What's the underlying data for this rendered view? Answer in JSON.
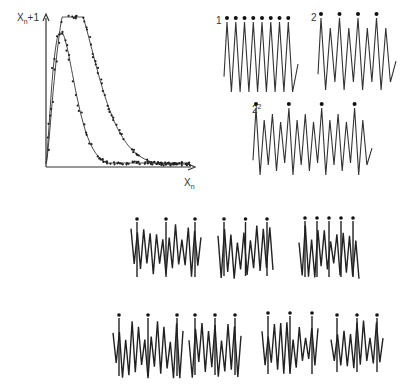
{
  "return_map": {
    "y_label_main": "X",
    "y_label_sub": "n",
    "y_label_suffix": "+1",
    "x_label_main": "X",
    "x_label_sub": "n",
    "origin": [
      46,
      167
    ],
    "x_axis_end": 195,
    "y_axis_end": 14,
    "outer_curve": {
      "peak_x": 62,
      "peak_y": 17,
      "tail_y": 164
    },
    "inner_curve": {
      "peak_x": 59,
      "peak_y": 33,
      "tail_y": 163
    },
    "color": "#333333"
  },
  "periodic_series": [
    {
      "label_main": "1",
      "label_sup": "",
      "x": 224,
      "y_top": 22,
      "y_bot": 92,
      "x_end": 298,
      "peaks": 8,
      "pattern": "period1",
      "dots": 8
    },
    {
      "label_main": "2",
      "label_sup": "",
      "x": 318,
      "y_top": 18,
      "y_bot": 90,
      "x_end": 396,
      "peaks": 8,
      "pattern": "period2",
      "dots": 4
    },
    {
      "label_main": "2",
      "label_sup": "2",
      "x": 253,
      "y_top": 108,
      "y_bot": 175,
      "x_end": 372,
      "peaks": 14,
      "pattern": "period4",
      "dots": 4
    }
  ],
  "chaotic_series": [
    {
      "x": 131,
      "y_top": 220,
      "y_bot": 281,
      "width": 70,
      "seed": 3,
      "dots": 3
    },
    {
      "x": 218,
      "y_top": 220,
      "y_bot": 280,
      "width": 55,
      "seed": 7,
      "dots": 3
    },
    {
      "x": 299,
      "y_top": 219,
      "y_bot": 281,
      "width": 60,
      "seed": 11,
      "dots": 5
    },
    {
      "x": 113,
      "y_top": 316,
      "y_bot": 380,
      "width": 70,
      "seed": 13,
      "dots": 3
    },
    {
      "x": 189,
      "y_top": 316,
      "y_bot": 379,
      "width": 52,
      "seed": 17,
      "dots": 3
    },
    {
      "x": 262,
      "y_top": 314,
      "y_bot": 378,
      "width": 56,
      "seed": 19,
      "dots": 3
    },
    {
      "x": 331,
      "y_top": 316,
      "y_bot": 376,
      "width": 52,
      "seed": 23,
      "dots": 3
    }
  ]
}
